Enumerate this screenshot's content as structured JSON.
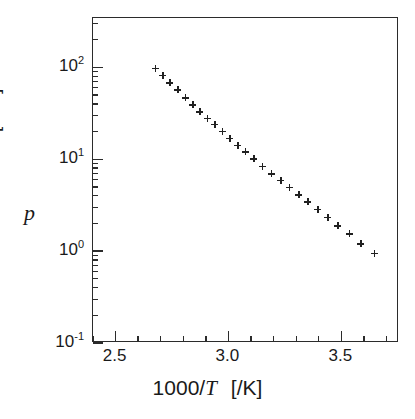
{
  "chart_data": {
    "type": "scatter",
    "title": "",
    "subtitle": "",
    "xlabel": "1000/T   [/K]",
    "xlabel_symbol": "1000/",
    "xlabel_symbol_italic": "T",
    "xlabel_unit": "[/K]",
    "ylabel": "p  [kPa]",
    "ylabel_symbol": "p",
    "ylabel_unit": "[kPa]",
    "xscale": "linear",
    "yscale": "log",
    "xlim": [
      2.4,
      3.7556
    ],
    "ylim": [
      0.1,
      344.0
    ],
    "grid": false,
    "legend": null,
    "marker": "plus",
    "marker_color": "#202020",
    "frame_color": "#2b2b2b",
    "background": "#ffffff",
    "xticks_major": [
      2.5,
      3.0,
      3.5
    ],
    "xticklabels": [
      "2.5",
      "3.0",
      "3.5"
    ],
    "xticks_minor": [
      2.4,
      2.6,
      2.7,
      2.8,
      2.9,
      3.1,
      3.2,
      3.3,
      3.4,
      3.6,
      3.7
    ],
    "yticks_major": [
      100,
      10,
      1,
      0.1
    ],
    "yticklabels": [
      "10",
      "10",
      "10",
      "10"
    ],
    "yticklabel_exponents": [
      "2",
      "1",
      "0",
      "-1"
    ],
    "yticks_minor": [
      300,
      200,
      90,
      80,
      70,
      60,
      50,
      40,
      30,
      20,
      9,
      8,
      7,
      6,
      5,
      4,
      3,
      2,
      0.9,
      0.8,
      0.7,
      0.6,
      0.5,
      0.4,
      0.3,
      0.2
    ],
    "x": [
      2.675,
      2.709,
      2.741,
      2.775,
      2.808,
      2.841,
      2.874,
      2.906,
      2.939,
      2.972,
      3.005,
      3.042,
      3.075,
      3.113,
      3.15,
      3.19,
      3.231,
      3.27,
      3.31,
      3.35,
      3.395,
      3.44,
      3.485,
      3.535,
      3.585,
      3.645
    ],
    "y": [
      98.0,
      82.0,
      68.0,
      57.0,
      46.5,
      39.0,
      33.0,
      28.0,
      24.0,
      20.2,
      17.0,
      14.2,
      12.0,
      10.1,
      8.4,
      7.0,
      5.9,
      4.95,
      4.1,
      3.45,
      2.85,
      2.35,
      1.9,
      1.55,
      1.2,
      0.95
    ],
    "n_points": 26,
    "series_name": "vapour pressure"
  },
  "axes": {
    "x_title_prefix": "1000/",
    "x_title_italic": "T",
    "x_title_unit": "[/K]",
    "y_title_italic": "p",
    "y_title_unit": "[kPa]"
  }
}
